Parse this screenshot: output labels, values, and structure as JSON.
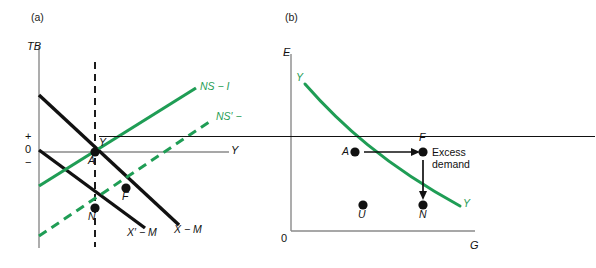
{
  "figure": {
    "background": "#ffffff",
    "colors": {
      "black": "#111111",
      "green": "#1f9d55",
      "axis_gray": "#8a8a8a"
    }
  },
  "panel_a": {
    "tag": "(a)",
    "vertical_axis_label": "TB",
    "horizontal_axis_label": "Y",
    "origin_labels": {
      "plus": "+",
      "zero": "0",
      "minus": "−"
    },
    "potential_output_label": "Y",
    "curves": [
      {
        "name": "NS - I",
        "label": "NS − I",
        "color": "#1f9d55",
        "style": "solid",
        "slope": "upward"
      },
      {
        "name": "NS' - I",
        "label": "NS′ −",
        "color": "#1f9d55",
        "style": "dashed",
        "slope": "upward"
      },
      {
        "name": "X - M",
        "label": "X − M",
        "color": "#111111",
        "style": "solid",
        "slope": "downward"
      },
      {
        "name": "X' - M",
        "label": "X′ − M",
        "color": "#111111",
        "style": "solid",
        "slope": "downward"
      }
    ],
    "points": [
      {
        "label": "A",
        "x": 95,
        "y": 152
      },
      {
        "label": "F",
        "x": 126,
        "y": 188
      },
      {
        "label": "N",
        "x": 95,
        "y": 208
      }
    ]
  },
  "panel_b": {
    "tag": "(b)",
    "vertical_axis_label": "E",
    "horizontal_axis_label": "G",
    "origin_label": "0",
    "curve_label_top": "Y",
    "curve_label_bottom": "Y",
    "annotation": {
      "line1": "Excess",
      "line2": "demand"
    },
    "points": [
      {
        "label": "A",
        "x": 355,
        "y": 152
      },
      {
        "label": "F",
        "x": 423,
        "y": 152
      },
      {
        "label": "U",
        "x": 363,
        "y": 205
      },
      {
        "label": "N",
        "x": 423,
        "y": 205
      }
    ]
  }
}
